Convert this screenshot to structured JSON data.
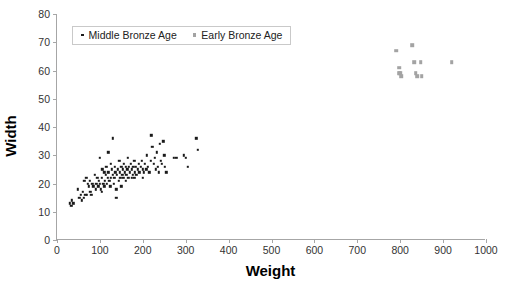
{
  "chart_data": {
    "type": "scatter",
    "title": "",
    "xlabel": "Weight",
    "ylabel": "Width",
    "xlim": [
      0,
      1000
    ],
    "ylim": [
      0,
      80
    ],
    "xticks": [
      0,
      100,
      200,
      300,
      400,
      500,
      600,
      700,
      800,
      900,
      1000
    ],
    "yticks": [
      0,
      10,
      20,
      30,
      40,
      50,
      60,
      70,
      80
    ],
    "grid": false,
    "legend_position": "top-left-inside",
    "series": [
      {
        "name": "Middle Bronze Age",
        "marker": "dot",
        "color": "#1a1a1a",
        "points": [
          [
            30,
            13
          ],
          [
            33,
            12
          ],
          [
            35,
            14
          ],
          [
            38,
            13
          ],
          [
            48,
            18
          ],
          [
            52,
            15
          ],
          [
            55,
            16
          ],
          [
            58,
            14
          ],
          [
            60,
            17
          ],
          [
            62,
            15
          ],
          [
            64,
            21
          ],
          [
            66,
            16
          ],
          [
            68,
            22
          ],
          [
            70,
            16
          ],
          [
            72,
            20
          ],
          [
            74,
            19
          ],
          [
            76,
            21
          ],
          [
            78,
            17
          ],
          [
            80,
            16
          ],
          [
            82,
            20
          ],
          [
            85,
            19
          ],
          [
            88,
            23
          ],
          [
            90,
            18
          ],
          [
            92,
            20
          ],
          [
            94,
            22
          ],
          [
            96,
            19
          ],
          [
            98,
            21
          ],
          [
            100,
            29
          ],
          [
            100,
            20
          ],
          [
            102,
            18
          ],
          [
            104,
            22
          ],
          [
            105,
            17
          ],
          [
            106,
            25
          ],
          [
            108,
            20
          ],
          [
            110,
            24
          ],
          [
            110,
            19
          ],
          [
            112,
            21
          ],
          [
            114,
            23
          ],
          [
            115,
            26
          ],
          [
            116,
            20
          ],
          [
            118,
            22
          ],
          [
            120,
            31
          ],
          [
            120,
            24
          ],
          [
            122,
            21
          ],
          [
            124,
            19
          ],
          [
            125,
            27
          ],
          [
            126,
            22
          ],
          [
            128,
            25
          ],
          [
            130,
            23
          ],
          [
            130,
            36
          ],
          [
            132,
            20
          ],
          [
            134,
            22
          ],
          [
            135,
            26
          ],
          [
            136,
            24
          ],
          [
            138,
            18
          ],
          [
            138,
            15
          ],
          [
            140,
            23
          ],
          [
            142,
            25
          ],
          [
            144,
            21
          ],
          [
            145,
            28
          ],
          [
            146,
            24
          ],
          [
            148,
            22
          ],
          [
            150,
            26
          ],
          [
            150,
            19
          ],
          [
            152,
            23
          ],
          [
            154,
            25
          ],
          [
            155,
            22
          ],
          [
            156,
            27
          ],
          [
            158,
            24
          ],
          [
            160,
            26
          ],
          [
            160,
            21
          ],
          [
            162,
            23
          ],
          [
            164,
            25
          ],
          [
            165,
            29
          ],
          [
            166,
            22
          ],
          [
            168,
            26
          ],
          [
            170,
            24
          ],
          [
            172,
            27
          ],
          [
            174,
            22
          ],
          [
            175,
            25
          ],
          [
            176,
            23
          ],
          [
            178,
            26
          ],
          [
            180,
            28
          ],
          [
            180,
            22
          ],
          [
            182,
            24
          ],
          [
            184,
            26
          ],
          [
            185,
            23
          ],
          [
            188,
            25
          ],
          [
            190,
            27
          ],
          [
            192,
            24
          ],
          [
            195,
            26
          ],
          [
            198,
            28
          ],
          [
            200,
            25
          ],
          [
            200,
            22
          ],
          [
            202,
            24
          ],
          [
            205,
            27
          ],
          [
            208,
            25
          ],
          [
            210,
            30
          ],
          [
            212,
            26
          ],
          [
            215,
            24
          ],
          [
            218,
            28
          ],
          [
            220,
            37
          ],
          [
            222,
            33
          ],
          [
            225,
            27
          ],
          [
            228,
            29
          ],
          [
            230,
            25
          ],
          [
            232,
            31
          ],
          [
            235,
            26
          ],
          [
            238,
            24
          ],
          [
            240,
            34
          ],
          [
            242,
            28
          ],
          [
            245,
            27
          ],
          [
            248,
            35
          ],
          [
            250,
            30
          ],
          [
            252,
            26
          ],
          [
            255,
            24
          ],
          [
            272,
            29
          ],
          [
            278,
            29
          ],
          [
            295,
            30
          ],
          [
            300,
            29
          ],
          [
            305,
            26
          ],
          [
            325,
            36
          ],
          [
            328,
            32
          ]
        ]
      },
      {
        "name": "Early Bronze Age",
        "marker": "square",
        "color": "#a3a3a3",
        "points": [
          [
            790,
            67
          ],
          [
            797,
            61
          ],
          [
            798,
            59
          ],
          [
            800,
            59
          ],
          [
            802,
            58
          ],
          [
            828,
            69
          ],
          [
            832,
            63
          ],
          [
            836,
            59
          ],
          [
            840,
            58
          ],
          [
            848,
            63
          ],
          [
            850,
            58
          ],
          [
            920,
            63
          ]
        ]
      }
    ]
  },
  "axes": {
    "x_title": "Weight",
    "y_title": "Width",
    "x_tick_labels": [
      "0",
      "100",
      "200",
      "300",
      "400",
      "500",
      "600",
      "700",
      "800",
      "900",
      "1000"
    ],
    "y_tick_labels": [
      "0",
      "10",
      "20",
      "30",
      "40",
      "50",
      "60",
      "70",
      "80"
    ]
  },
  "legend": {
    "entries": [
      {
        "label": "Middle Bronze Age",
        "marker": "dot-marker",
        "color": "#1a1a1a"
      },
      {
        "label": "Early Bronze Age",
        "marker": "square-marker",
        "color": "#a3a3a3"
      }
    ]
  },
  "colors": {
    "middle_bronze_age": "#1a1a1a",
    "early_bronze_age": "#a3a3a3",
    "axis": "#a6a6a6",
    "background": "#ffffff"
  }
}
